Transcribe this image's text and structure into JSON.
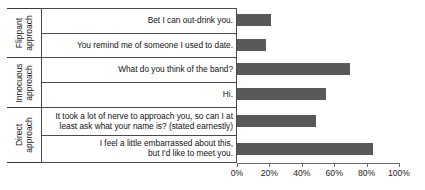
{
  "chart_data": {
    "type": "bar",
    "orientation": "horizontal",
    "title": "",
    "xlabel": "",
    "ylabel": "",
    "xlim": [
      0,
      100
    ],
    "xtick_labels": [
      "0%",
      "20%",
      "40%",
      "60%",
      "80%",
      "100%"
    ],
    "xtick_values": [
      0,
      20,
      40,
      60,
      80,
      100
    ],
    "grid": false,
    "legend": "none",
    "bar_color": "#595959",
    "groups": [
      {
        "label_line1": "Flippant",
        "label_line2": "approach",
        "items": [
          {
            "label": "Bet I can out-drink you.",
            "value": 21
          },
          {
            "label": "You remind me of someone I used to date.",
            "value": 18
          }
        ]
      },
      {
        "label_line1": "Innocuous",
        "label_line2": "approach",
        "items": [
          {
            "label": "What do you think of the band?",
            "value": 70
          },
          {
            "label": "Hi.",
            "value": 55
          }
        ]
      },
      {
        "label_line1": "Direct",
        "label_line2": "approach",
        "items": [
          {
            "label": "It took a lot of nerve to approach you, so can I at\nleast ask what your name is? (stated earnestly)",
            "value": 49
          },
          {
            "label": "I feel a little embarrassed about this,\nbut I'd like to meet you.",
            "value": 84
          }
        ]
      }
    ],
    "categories": [
      "Bet I can out-drink you.",
      "You remind me of someone I used to date.",
      "What do you think of the band?",
      "Hi.",
      "It took a lot of nerve to approach you, so can I at least ask what your name is? (stated earnestly)",
      "I feel a little embarrassed about this, but I'd like to meet you."
    ],
    "values": [
      21,
      18,
      70,
      55,
      49,
      84
    ]
  }
}
